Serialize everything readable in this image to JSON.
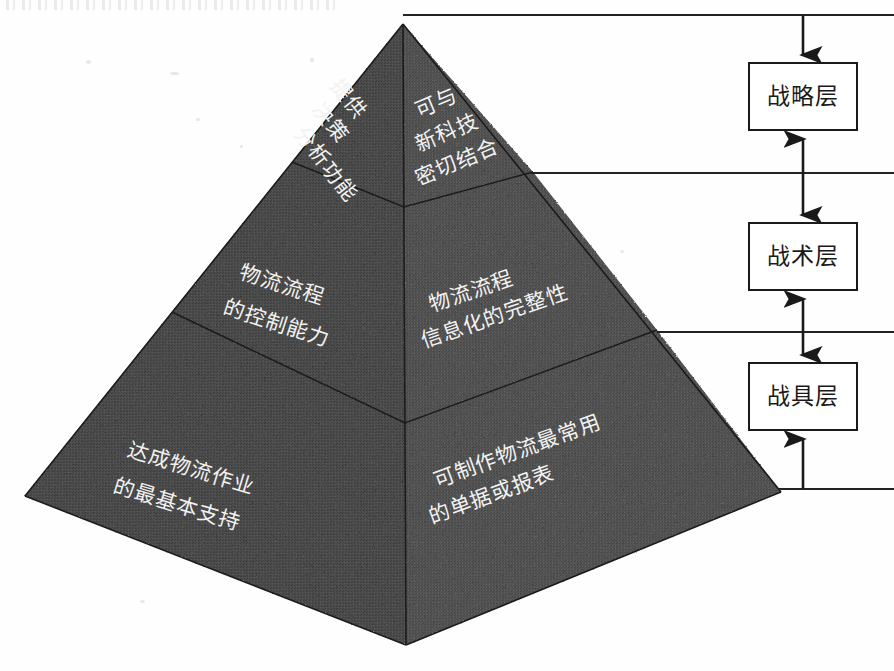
{
  "diagram": {
    "title_artifact": "",
    "pyramid": {
      "name": "logistics-information-system-pyramid",
      "fill_color": "#4b4b4b",
      "edge_color": "#1f1f1f",
      "label_color": "#f0f0f0",
      "tiers": [
        {
          "id": "tier-top",
          "level": "战略层",
          "left_face_lines": [
            "提供",
            "决策",
            "分析功能"
          ],
          "right_face_lines": [
            "可与",
            "新科技",
            "密切结合"
          ]
        },
        {
          "id": "tier-middle",
          "level": "战术层",
          "left_face_lines": [
            "物流流程",
            "的控制能力"
          ],
          "right_face_lines": [
            "物流流程",
            "信息化的完整性"
          ]
        },
        {
          "id": "tier-bottom",
          "level": "战具层",
          "left_face_lines": [
            "达成物流作业",
            "的最基本支持"
          ],
          "right_face_lines": [
            "可制作物流最常用",
            "的单据或报表"
          ]
        }
      ]
    },
    "flow": {
      "boxes": [
        {
          "id": "box-strategic",
          "label": "战略层"
        },
        {
          "id": "box-tactical",
          "label": "战术层"
        },
        {
          "id": "box-tool",
          "label": "战具层"
        }
      ],
      "arrow_color": "#1a1a1a",
      "leader_line_color": "#222222"
    }
  }
}
